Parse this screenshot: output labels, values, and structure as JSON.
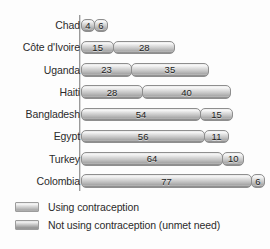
{
  "chart_data": {
    "type": "bar",
    "orientation": "horizontal",
    "stacked": true,
    "title": "",
    "subtitle": "",
    "xlabel": "",
    "ylabel": "",
    "grid": false,
    "legend_position": "bottom-left",
    "xlim": [
      0,
      100
    ],
    "categories": [
      "Chad",
      "Côte d'Ivoire",
      "Uganda",
      "Haiti",
      "Bangladesh",
      "Egypt",
      "Turkey",
      "Colombia"
    ],
    "series": [
      {
        "name": "Using contraception",
        "values": [
          4,
          15,
          23,
          28,
          54,
          56,
          64,
          77
        ]
      },
      {
        "name": "Not using contraception (unmet need)",
        "values": [
          6,
          28,
          35,
          40,
          15,
          11,
          10,
          6
        ]
      }
    ],
    "totals": [
      10,
      43,
      58,
      68,
      69,
      67,
      74,
      83
    ],
    "legend": [
      "Using contraception",
      "Not using contraception (unmet need)"
    ],
    "colors": {
      "series1": "#cccccc",
      "series2": "#bdbdbd",
      "axis": "#9a9a9a",
      "text": "#2b2b2b",
      "background": "#fdfdfd"
    }
  }
}
